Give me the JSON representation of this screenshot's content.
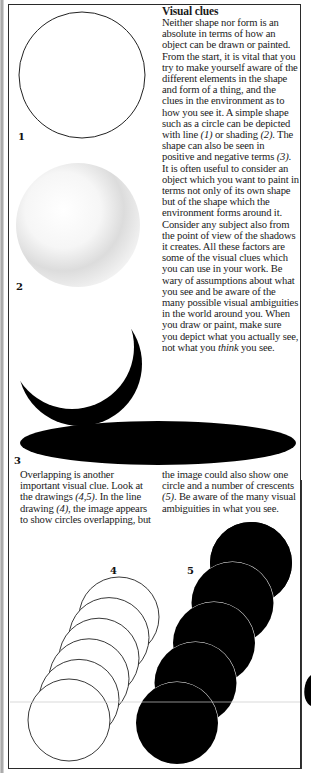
{
  "article": {
    "title": "Visual clues",
    "intro_paragraph": {
      "before_1": "Neither shape nor form is an absolute in terms of how an object can be drawn or painted. From the start, it is vital that you try to make yourself aware of the different elements in the shape and form of a thing, and the clues in the environment as to how you see it. A simple shape such as a circle can be depicted with line ",
      "ref_1": "(1)",
      "between_1_2": " or shading ",
      "ref_2": "(2)",
      "between_2_3": ". The shape can also be seen in positive and negative terms ",
      "ref_3": "(3)",
      "after_3": ". It is often useful to consider an object which you want to paint in terms not only of its own shape but of the shape which the environment forms around it. Consider any subject also from the point of view of the shadows it creates. All these factors are some of the visual clues which you can use in your work. Be wary of assumptions about what you see and be aware of the many possible visual ambiguities in the world around you. When you draw or paint, make sure you depict what you actually see, not what you ",
      "emphasis": "think",
      "ending": " you see."
    },
    "overlap_paragraph": {
      "left": {
        "part1": "Overlapping is another important visual clue. Look at the drawings ",
        "ref_45": "(4,5)",
        "part2": ". In the line drawing ",
        "ref_4": "(4)",
        "part3": ", the image appears to show circles overlapping, but"
      },
      "right": {
        "part1": "the image could also show one circle and a number of crescents ",
        "ref_5": "(5)",
        "part2": ". Be aware of the many visual ambiguities in what you see."
      }
    }
  },
  "figures": {
    "fig1": {
      "label": "1",
      "description": "outline circle drawn with line"
    },
    "fig2": {
      "label": "2",
      "description": "circle depicted with shading"
    },
    "fig3": {
      "label": "3",
      "description": "black crescent and elliptical shadow, positive/negative shape"
    },
    "fig4": {
      "label": "4",
      "description": "six outline circles appearing to overlap"
    },
    "fig5": {
      "label": "5",
      "description": "one black circle and four black crescents"
    }
  },
  "colors": {
    "ink": "#000000",
    "paper": "#ffffff",
    "frame": "#2a2a2a"
  }
}
